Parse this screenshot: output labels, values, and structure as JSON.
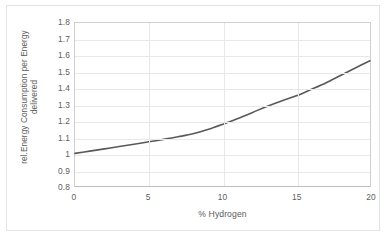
{
  "chart_data": {
    "type": "line",
    "title": "",
    "xlabel": "% Hydrogen",
    "ylabel": "rel.Energy Consumption per Energy delivered",
    "ylabel_line1": "rel.Energy Consumption per Energy",
    "ylabel_line2": "delivered",
    "xlim": [
      0,
      20
    ],
    "ylim": [
      0.8,
      1.8
    ],
    "xticks": [
      0,
      5,
      10,
      15,
      20
    ],
    "xtick_labels": [
      "0",
      "5",
      "10",
      "15",
      "20"
    ],
    "yticks": [
      0.8,
      0.9,
      1.0,
      1.1,
      1.2,
      1.3,
      1.4,
      1.5,
      1.6,
      1.7,
      1.8
    ],
    "ytick_labels": [
      "0.8",
      "0.9",
      "1",
      "1.1",
      "1.2",
      "1.3",
      "1.4",
      "1.5",
      "1.6",
      "1.7",
      "1.8"
    ],
    "grid": true,
    "grid_axis": "both",
    "legend": false,
    "legend_position": "none",
    "series": [
      {
        "name": "rel. Energy Consumption per Energy delivered",
        "color": "#595959",
        "line_width": 1.6,
        "markers": false,
        "x": [
          0,
          1,
          2,
          3,
          4,
          5,
          6,
          7,
          8,
          9,
          10,
          11,
          12,
          13,
          14,
          15,
          16,
          17,
          18,
          19,
          20
        ],
        "values": [
          1.0,
          1.014,
          1.028,
          1.042,
          1.056,
          1.071,
          1.086,
          1.102,
          1.12,
          1.146,
          1.178,
          1.213,
          1.25,
          1.288,
          1.322,
          1.353,
          1.392,
          1.432,
          1.478,
          1.524,
          1.568
        ]
      }
    ]
  },
  "style": {
    "line_color": "#595959",
    "grid_color": "#e8e8e8",
    "axis_color": "#d0d0d0",
    "text_color": "#5a5a5a",
    "background": "#ffffff",
    "frame_color": "#e3e3e3"
  }
}
